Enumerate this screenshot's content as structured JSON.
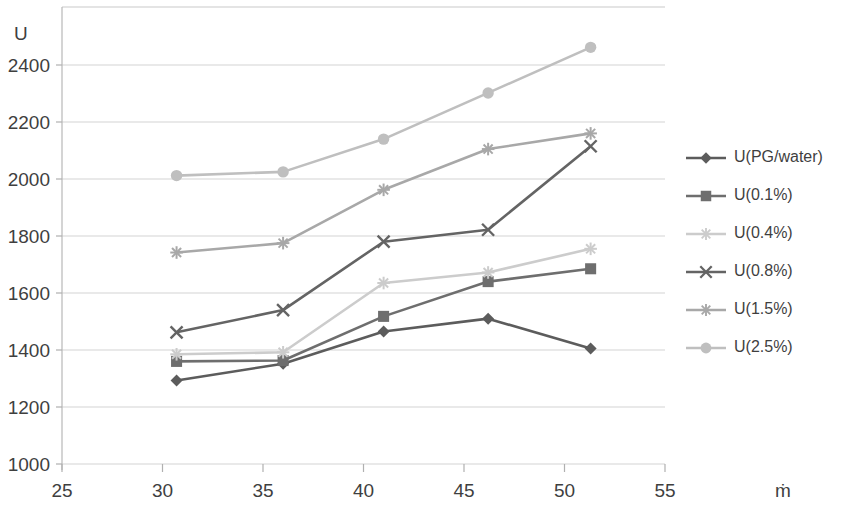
{
  "chart_data": {
    "type": "line",
    "title": "",
    "subtitle": "",
    "xlabel": "ṁ",
    "ylabel": "U",
    "xlim": [
      25,
      55
    ],
    "ylim": [
      1000,
      2500
    ],
    "xticks": [
      25,
      30,
      35,
      40,
      45,
      50,
      55
    ],
    "yticks": [
      1000,
      1200,
      1400,
      1600,
      1800,
      2000,
      2200,
      2400
    ],
    "grid": true,
    "grid_axis": "y",
    "legend_position": "right",
    "x": [
      30.7,
      36.0,
      41.0,
      46.2,
      51.3
    ],
    "series": [
      {
        "name": "U(PG/water)",
        "marker": "diamond",
        "color": "#5c5c5c",
        "values": [
          1293,
          1352,
          1465,
          1510,
          1405
        ]
      },
      {
        "name": "U(0.1%)",
        "marker": "square",
        "color": "#6e6e6e",
        "values": [
          1360,
          1363,
          1518,
          1640,
          1685
        ]
      },
      {
        "name": "U(0.4%)",
        "marker": "star",
        "color": "#cccccc",
        "values": [
          1385,
          1392,
          1635,
          1672,
          1755
        ]
      },
      {
        "name": "U(0.8%)",
        "marker": "x",
        "color": "#646464",
        "values": [
          1462,
          1540,
          1780,
          1822,
          2115
        ]
      },
      {
        "name": "U(1.5%)",
        "marker": "asterisk",
        "color": "#a8a8a8",
        "values": [
          1742,
          1775,
          1962,
          2105,
          2160
        ]
      },
      {
        "name": "U(2.5%)",
        "marker": "circle",
        "color": "#bfbfbf",
        "values": [
          2012,
          2025,
          2140,
          2302,
          2462
        ]
      }
    ]
  },
  "axes": {
    "y_axis_title": "U",
    "x_axis_title": "ṁ",
    "y_tick_labels": [
      "2400",
      "2200",
      "2000",
      "1800",
      "1600",
      "1400",
      "1200",
      "1000"
    ],
    "x_tick_labels": [
      "25",
      "30",
      "35",
      "40",
      "45",
      "50",
      "55"
    ]
  },
  "legend": {
    "items": [
      {
        "label": "U(PG/water)",
        "color": "#5c5c5c",
        "marker": "diamond"
      },
      {
        "label": "U(0.1%)",
        "color": "#6e6e6e",
        "marker": "square"
      },
      {
        "label": "U(0.4%)",
        "color": "#cccccc",
        "marker": "star"
      },
      {
        "label": "U(0.8%)",
        "color": "#646464",
        "marker": "x"
      },
      {
        "label": "U(1.5%)",
        "color": "#a8a8a8",
        "marker": "asterisk"
      },
      {
        "label": "U(2.5%)",
        "color": "#bfbfbf",
        "marker": "circle"
      }
    ]
  }
}
